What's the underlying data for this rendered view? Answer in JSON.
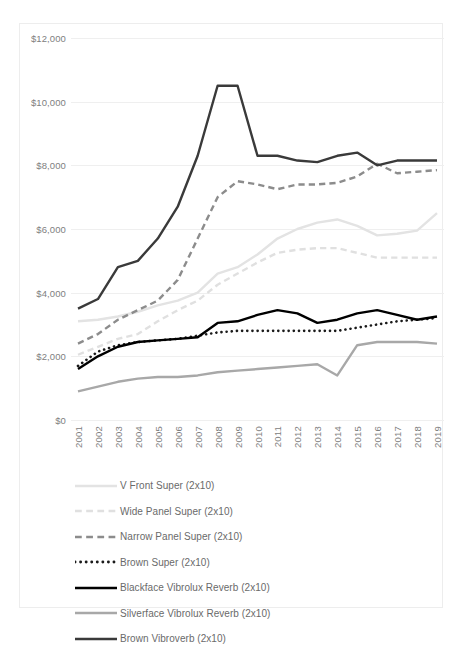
{
  "chart_data": {
    "type": "line",
    "title": "",
    "xlabel": "",
    "ylabel": "",
    "grid": true,
    "legend_position": "bottom",
    "ylim": [
      0,
      12000
    ],
    "ytick_values": [
      0,
      2000,
      4000,
      6000,
      8000,
      10000,
      12000
    ],
    "ytick_labels": [
      "$0",
      "$2,000",
      "$4,000",
      "$6,000",
      "$8,000",
      "$10,000",
      "$12,000"
    ],
    "categories": [
      "2001",
      "2002",
      "2003",
      "2004",
      "2005",
      "2006",
      "2007",
      "2008",
      "2009",
      "2010",
      "2011",
      "2012",
      "2013",
      "2014",
      "2015",
      "2016",
      "2017",
      "2018",
      "2019"
    ],
    "series": [
      {
        "name": "V Front Super (2x10)",
        "color": "#e3e3e3",
        "style": "solid",
        "values": [
          3100,
          3150,
          3250,
          3400,
          3600,
          3750,
          4000,
          4600,
          4800,
          5200,
          5700,
          6000,
          6200,
          6300,
          6100,
          5800,
          5850,
          5950,
          6500
        ]
      },
      {
        "name": "Wide Panel Super (2x10)",
        "color": "#e0e0e0",
        "style": "dashed",
        "values": [
          2050,
          2300,
          2550,
          2700,
          3100,
          3450,
          3750,
          4250,
          4600,
          4950,
          5250,
          5350,
          5400,
          5400,
          5250,
          5100,
          5100,
          5100,
          5100
        ]
      },
      {
        "name": "Narrow Panel Super (2x10)",
        "color": "#8c8c8c",
        "style": "dashed",
        "values": [
          2400,
          2700,
          3150,
          3450,
          3750,
          4400,
          5700,
          7000,
          7500,
          7400,
          7250,
          7400,
          7400,
          7450,
          7650,
          8050,
          7750,
          7800,
          7850
        ]
      },
      {
        "name": "Brown Super (2x10)",
        "color": "#1a1a1a",
        "style": "dotted",
        "values": [
          1700,
          2150,
          2350,
          2450,
          2500,
          2550,
          2650,
          2750,
          2800,
          2800,
          2800,
          2800,
          2800,
          2800,
          2900,
          3000,
          3100,
          3150,
          3200
        ]
      },
      {
        "name": "Blackface Vibrolux Reverb (2x10)",
        "color": "#000000",
        "style": "solid",
        "values": [
          1600,
          2000,
          2300,
          2450,
          2500,
          2550,
          2600,
          3050,
          3100,
          3300,
          3450,
          3350,
          3050,
          3150,
          3350,
          3450,
          3300,
          3150,
          3250
        ]
      },
      {
        "name": "Silverface Vibrolux Reverb (2x10)",
        "color": "#a8a8a8",
        "style": "solid",
        "values": [
          900,
          1050,
          1200,
          1300,
          1350,
          1350,
          1400,
          1500,
          1550,
          1600,
          1650,
          1700,
          1750,
          1400,
          2350,
          2450,
          2450,
          2450,
          2400
        ]
      },
      {
        "name": "Brown Vibroverb (2x10)",
        "color": "#3a3a3a",
        "style": "solid",
        "values": [
          3500,
          3800,
          4800,
          5000,
          5700,
          6700,
          8300,
          10500,
          10500,
          8300,
          8300,
          8150,
          8100,
          8300,
          8400,
          8000,
          8150,
          8150,
          8150
        ]
      }
    ]
  },
  "legend": {
    "items": [
      {
        "label": "V Front Super (2x10)"
      },
      {
        "label": "Wide Panel Super (2x10)"
      },
      {
        "label": "Narrow Panel Super (2x10)"
      },
      {
        "label": "Brown Super (2x10)"
      },
      {
        "label": "Blackface Vibrolux Reverb (2x10)"
      },
      {
        "label": "Silverface Vibrolux Reverb (2x10)"
      },
      {
        "label": "Brown Vibroverb (2x10)"
      }
    ]
  }
}
